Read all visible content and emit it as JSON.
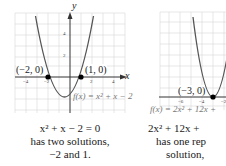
{
  "figures": [
    {
      "id": "left",
      "function_label": "f(x) = x² + x − 2",
      "axis_x_label": "x",
      "axis_y_label": "y",
      "x_ticks": [
        "−4",
        "−2",
        "2",
        "4"
      ],
      "y_ticks": [
        "2",
        "4"
      ],
      "points": [
        {
          "label": "(−2, 0)",
          "x": -2,
          "y": 0
        },
        {
          "label": "(1, 0)",
          "x": 1,
          "y": 0
        }
      ],
      "caption": {
        "equation": "x² + x − 2 = 0",
        "line2": "has two solutions,",
        "line3": "−2 and 1."
      }
    },
    {
      "id": "right",
      "function_label": "f(x) = 2x² + 12x +",
      "x_ticks": [
        "−6",
        "−4",
        "−2"
      ],
      "points": [
        {
          "label": "(−3, 0)",
          "x": -3,
          "y": 0
        }
      ],
      "caption": {
        "equation": "2x² + 12x +",
        "line2": "has one rep",
        "line3": "solution,"
      }
    }
  ],
  "colors": {
    "grid": "#d6d6d6",
    "axis": "#333333",
    "curve": "#555555",
    "point": "#000000",
    "label_overlay": "#ffffff"
  }
}
